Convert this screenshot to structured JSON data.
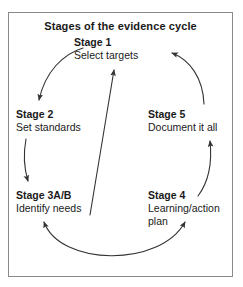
{
  "figure": {
    "title": "Stages of the evidence cycle",
    "frame_color": "#8a8a8a",
    "background_color": "#ffffff",
    "text_color": "#1a1a1a",
    "arrow_color": "#333333"
  },
  "stages": [
    {
      "id": "stage1",
      "title": "Stage 1",
      "description": "Select targets"
    },
    {
      "id": "stage2",
      "title": "Stage 2",
      "description": "Set standards"
    },
    {
      "id": "stage3",
      "title": "Stage 3A/B",
      "description": "Identify needs"
    },
    {
      "id": "stage4",
      "title": "Stage 4",
      "description": "Learning/action plan"
    },
    {
      "id": "stage5",
      "title": "Stage 5",
      "description": "Document it all"
    }
  ],
  "arrows": [
    {
      "id": "stage1-to-stage2",
      "from": "Stage 1",
      "to": "Stage 2",
      "style": "curved",
      "heads": "single"
    },
    {
      "id": "stage2-to-stage3",
      "from": "Stage 2",
      "to": "Stage 3A/B",
      "style": "curved",
      "heads": "single"
    },
    {
      "id": "stage3-to-stage4",
      "from": "Stage 3A/B",
      "to": "Stage 4",
      "style": "curved",
      "heads": "double"
    },
    {
      "id": "stage4-to-stage5",
      "from": "Stage 4",
      "to": "Stage 5",
      "style": "curved",
      "heads": "single"
    },
    {
      "id": "stage5-to-stage1",
      "from": "Stage 5",
      "to": "Stage 1",
      "style": "curved",
      "heads": "single"
    },
    {
      "id": "stage3-to-stage1",
      "from": "Stage 3A/B",
      "to": "Stage 1",
      "style": "straight",
      "heads": "single"
    }
  ]
}
